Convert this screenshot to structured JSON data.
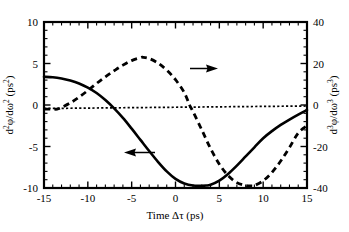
{
  "chart_data": {
    "type": "line",
    "title": "",
    "xlabel": "Time Δτ (ps)",
    "ylabel_left": "d²φ/dω² (ps²)",
    "ylabel_right": "d³φ/dω³ (ps³)",
    "xlim": [
      -15,
      15
    ],
    "ylim_left": [
      -10,
      10
    ],
    "ylim_right": [
      -40,
      40
    ],
    "xticks": [
      -15,
      -10,
      -5,
      0,
      5,
      10,
      15
    ],
    "xtick_labels": [
      "-15",
      "-10",
      "-5",
      "0",
      "5",
      "10",
      "15"
    ],
    "yticks_left": [
      -10,
      -5,
      0,
      5,
      10
    ],
    "ytick_labels_left": [
      "-10",
      "-5",
      "0",
      "5",
      "10"
    ],
    "yticks_right": [
      -40,
      -20,
      0,
      20,
      40
    ],
    "ytick_labels_right": [
      "-40",
      "-20",
      "0",
      "20",
      "40"
    ],
    "x_minor_tick_interval": 1,
    "y_minor_tick_interval_left": 1,
    "y_minor_tick_interval_right": 4,
    "grid": false,
    "legend": "none",
    "series": [
      {
        "name": "d2phi/domega2",
        "axis": "left",
        "style": "solid",
        "x": [
          -15,
          -14,
          -13,
          -12,
          -11,
          -10,
          -9,
          -8,
          -7,
          -6,
          -5,
          -4,
          -3,
          -2,
          -1,
          0,
          1,
          2,
          3,
          3.5,
          4,
          5,
          6,
          7,
          8,
          9,
          10,
          11,
          12,
          13,
          14,
          15
        ],
        "y": [
          3.4,
          3.35,
          3.2,
          2.95,
          2.6,
          2.1,
          1.45,
          0.6,
          -0.4,
          -1.55,
          -2.85,
          -4.2,
          -5.55,
          -6.85,
          -8.0,
          -8.9,
          -9.45,
          -9.7,
          -9.72,
          -9.7,
          -9.6,
          -9.1,
          -8.3,
          -7.3,
          -6.2,
          -5.1,
          -4.0,
          -3.15,
          -2.4,
          -1.75,
          -1.15,
          -0.6
        ]
      },
      {
        "name": "d3phi/domega3",
        "axis": "right",
        "style": "dashed",
        "x": [
          -15,
          -14,
          -13.5,
          -13,
          -12,
          -11,
          -10,
          -9,
          -8,
          -7,
          -6,
          -5,
          -4,
          -3.7,
          -3,
          -2,
          -1,
          0,
          1,
          1.6,
          2,
          3,
          4,
          5,
          6,
          7,
          8,
          8.6,
          9,
          10,
          11,
          12,
          13,
          14,
          15
        ],
        "y_right": [
          -2.0,
          -2.0,
          -2.0,
          -1.2,
          1.0,
          3.8,
          7.0,
          10.4,
          13.6,
          16.5,
          19.2,
          21.4,
          22.8,
          23.0,
          22.4,
          20.2,
          16.8,
          12.2,
          6.0,
          0.0,
          -3.2,
          -12.0,
          -21.0,
          -28.5,
          -34.0,
          -37.4,
          -38.8,
          -39.0,
          -38.8,
          -36.5,
          -32.5,
          -27.0,
          -20.5,
          -13.5,
          -10.0
        ]
      },
      {
        "name": "zero-reference",
        "axis": "left",
        "style": "dotted",
        "x": [
          -15,
          15
        ],
        "y": [
          -0.42,
          -0.12
        ]
      }
    ],
    "annotations": [
      {
        "name": "left-arrow",
        "label": "",
        "points_to": "left-axis",
        "direction": "left",
        "data_x": -1.8,
        "data_y_left": -5.2
      },
      {
        "name": "right-arrow",
        "label": "",
        "points_to": "right-axis",
        "direction": "right",
        "data_x": 5.6,
        "data_y_left": 4.45
      }
    ]
  }
}
